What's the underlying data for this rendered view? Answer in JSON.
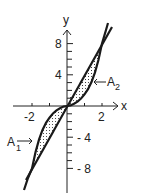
{
  "figure": {
    "axes": {
      "x_label": "x",
      "y_label": "y",
      "x_ticks": [
        -2,
        -1,
        0,
        1,
        2
      ],
      "x_tick_labels": [
        "-2",
        "2"
      ],
      "y_ticks": [
        -8,
        -7,
        -6,
        -5,
        -4,
        -3,
        -2,
        -1,
        1,
        2,
        3,
        4,
        5,
        6,
        7,
        8
      ],
      "y_tick_labels_pos": [
        "8",
        "4"
      ],
      "y_tick_labels_neg": [
        "- 4",
        "- 8"
      ]
    },
    "curves": [
      {
        "name": "cubic",
        "equation": "y = x^3"
      },
      {
        "name": "line",
        "equation": "y = 4x"
      }
    ],
    "regions": [
      {
        "label": "A",
        "subscript": "1",
        "x_range": [
          -2,
          0
        ]
      },
      {
        "label": "A",
        "subscript": "2",
        "x_range": [
          0,
          2
        ]
      }
    ],
    "colors": {
      "ink": "#222222",
      "background": "#ffffff"
    }
  }
}
